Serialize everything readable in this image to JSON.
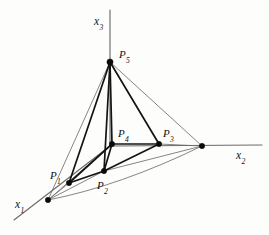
{
  "figure": {
    "type": "geometric-diagram",
    "background_color": "#fdfdfc",
    "stroke_color_thick": "#141414",
    "stroke_color_thin": "#6f6f6f",
    "axis_color": "#6b6b6b",
    "axes": [
      {
        "id": "x1",
        "label": "x",
        "subscript": "1",
        "label_x": 15,
        "label_y": 199
      },
      {
        "id": "x2",
        "label": "x",
        "subscript": "2",
        "label_x": 236,
        "label_y": 150
      },
      {
        "id": "x3",
        "label": "x",
        "subscript": "3",
        "label_x": 94,
        "label_y": 16
      }
    ],
    "points": [
      {
        "id": "P1",
        "label": "P",
        "subscript": "1",
        "x": 69,
        "y": 183,
        "label_x": 50,
        "label_y": 170
      },
      {
        "id": "P2",
        "label": "P",
        "subscript": "2",
        "x": 104,
        "y": 171,
        "label_x": 97,
        "label_y": 180
      },
      {
        "id": "P3",
        "label": "P",
        "subscript": "3",
        "x": 159,
        "y": 144,
        "label_x": 163,
        "label_y": 128
      },
      {
        "id": "P4",
        "label": "P",
        "subscript": "4",
        "x": 112,
        "y": 144,
        "label_x": 118,
        "label_y": 128
      },
      {
        "id": "P5",
        "label": "P",
        "subscript": "5",
        "x": 110,
        "y": 62,
        "label_x": 119,
        "label_y": 49
      }
    ],
    "axis_intercepts": [
      {
        "id": "x1-intercept",
        "x": 48,
        "y": 200
      },
      {
        "id": "x2-intercept",
        "x": 202,
        "y": 146
      }
    ],
    "origin": {
      "x": 110,
      "y": 146
    }
  }
}
